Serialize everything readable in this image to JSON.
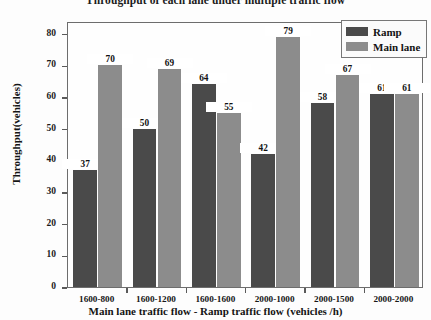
{
  "chart_data": {
    "type": "bar",
    "title": "Throughput of each lane under multiple traffic flow",
    "xlabel": "Main lane traffic flow - Ramp traffic flow (vehicles /h)",
    "ylabel": "Throughput(vehicles)",
    "categories": [
      "1600-800",
      "1600-1200",
      "1600-1600",
      "2000-1000",
      "2000-1500",
      "2000-2000"
    ],
    "series": [
      {
        "name": "Ramp",
        "color": "#4a4a4a",
        "values": [
          37,
          50,
          64,
          42,
          58,
          61
        ]
      },
      {
        "name": "Main lane",
        "color": "#8c8c8c",
        "values": [
          70,
          69,
          55,
          79,
          67,
          61
        ]
      }
    ],
    "ylim": [
      0,
      84
    ],
    "yticks": [
      0,
      10,
      20,
      30,
      40,
      50,
      60,
      70,
      80
    ],
    "ytick_labels": [
      "0",
      "10",
      "20",
      "30",
      "40",
      "50",
      "60",
      "70",
      "80"
    ],
    "grid": false,
    "legend_position": "upper right",
    "value_labels": true
  },
  "legend": {
    "entries": [
      {
        "label": "Ramp"
      },
      {
        "label": "Main lane"
      }
    ]
  }
}
